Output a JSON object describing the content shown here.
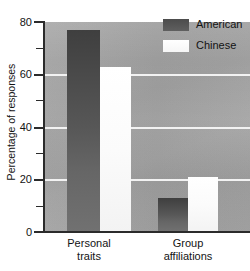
{
  "chart_data": {
    "type": "bar",
    "title": "",
    "xlabel": "",
    "ylabel": "Percentage of responses",
    "categories": [
      "Personal traits",
      "Group affiliations"
    ],
    "category_lines": [
      [
        "Personal",
        "traits"
      ],
      [
        "Group",
        "affiliations"
      ]
    ],
    "series": [
      {
        "name": "American",
        "color": "#4a4a4a",
        "values": [
          77,
          13
        ]
      },
      {
        "name": "Chinese",
        "color": "#fbfbfb",
        "values": [
          63,
          21
        ]
      }
    ],
    "ylim": [
      0,
      80
    ],
    "yticks": [
      0,
      20,
      40,
      60,
      80
    ],
    "ytick_labels": [
      "0",
      "20",
      "40",
      "60",
      "80"
    ],
    "yticks_minor": [
      10,
      30,
      50,
      70
    ],
    "grid": "horizontal-white-at-20-40-60",
    "legend_position": "top-right",
    "plot_background": "#9e9e9e"
  },
  "axes": {
    "y_title": "Percentage of responses",
    "tick_80": "80",
    "tick_60": "60",
    "tick_40": "40",
    "tick_20": "20",
    "tick_0": "0"
  },
  "legend": {
    "entries": [
      {
        "label": "American",
        "swatch": "dark-gray-swatch"
      },
      {
        "label": "Chinese",
        "swatch": "white-swatch"
      }
    ]
  },
  "categories": {
    "group1_line1": "Personal",
    "group1_line2": "traits",
    "group2_line1": "Group",
    "group2_line2": "affiliations"
  }
}
